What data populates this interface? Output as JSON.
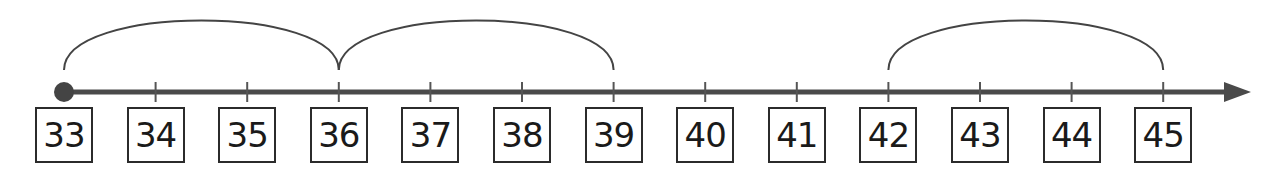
{
  "number_line": {
    "start": 33,
    "end": 45,
    "step": 1,
    "origin_x": 64,
    "spacing": 91.6,
    "axis_y": 92,
    "start_marker": "filled-dot",
    "end_marker": "arrow",
    "line_color": "#4a4a4a",
    "labels": [
      "33",
      "34",
      "35",
      "36",
      "37",
      "38",
      "39",
      "40",
      "41",
      "42",
      "43",
      "44",
      "45"
    ],
    "jumps": [
      {
        "from": 33,
        "to": 36,
        "size": 3
      },
      {
        "from": 36,
        "to": 39,
        "size": 3
      },
      {
        "from": 42,
        "to": 45,
        "size": 3
      }
    ]
  }
}
